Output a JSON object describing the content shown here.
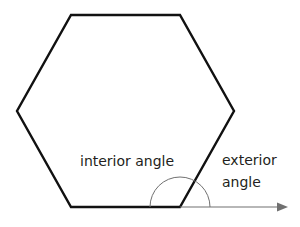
{
  "diagram": {
    "shape": "hexagon",
    "labels": {
      "interior": "interior angle",
      "exterior_line1": "exterior",
      "exterior_line2": "angle"
    },
    "colors": {
      "outline": "#111111",
      "arc": "#707070",
      "arrow": "#707070",
      "text": "#231f20"
    }
  }
}
